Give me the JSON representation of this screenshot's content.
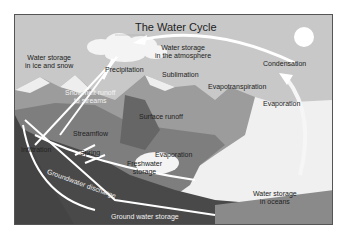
{
  "title": "The Water Cycle",
  "labels": {
    "ice_snow": "Water storage\nin ice and snow",
    "atmosphere": "Water storage\nin the atmosphere",
    "condensation": "Condensation",
    "precipitation": "Precipitation",
    "sublimation": "Sublimation",
    "evapotranspiration": "Evapotranspiration",
    "evaporation_ocean": "Evaporation",
    "snowmelt": "Snowmelt runoff\nto streams",
    "surface_runoff": "Surface runoff",
    "streamflow": "Streamflow",
    "infiltration": "Infiltration",
    "spring": "Spring",
    "evaporation_lake": "Evaporation",
    "freshwater": "Freshwater\nstorage",
    "groundwater_discharge": "Groundwater discharge",
    "groundwater_storage": "Ground water storage",
    "oceans": "Water storage\nin oceans"
  },
  "colors": {
    "sky": "#c9c9c9",
    "sun": "#ffffff",
    "mountain": "#9a9a9a",
    "land": "#7d7d7d",
    "ground": "#4a4a4a",
    "ocean": "#f0f0f0",
    "arrow": "#ffffff"
  }
}
